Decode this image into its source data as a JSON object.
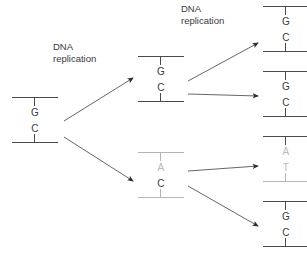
{
  "figure": {
    "label_color": "#3a3a3a",
    "normal_color": "#4a4a4a",
    "mutant_color": "#b9b9b9",
    "background": "#ffffff"
  },
  "labels": [
    {
      "id": "label-gen1",
      "text": "DNA\nreplication",
      "x": 53,
      "y": 41
    },
    {
      "id": "label-gen2",
      "text": "DNA\nreplication",
      "x": 181,
      "y": 3
    }
  ],
  "generations": [
    {
      "name": "parent",
      "units": [
        {
          "id": "unit-parent",
          "x": 12,
          "y": 97,
          "top_base": "G",
          "bottom_base": "C",
          "top_base_mutant": false,
          "bottom_base_mutant": false,
          "top_rail_mutant": false,
          "bottom_rail_mutant": false
        }
      ]
    },
    {
      "name": "first-generation",
      "units": [
        {
          "id": "unit-gen1-top",
          "x": 138,
          "y": 56,
          "top_base": "G",
          "bottom_base": "C",
          "top_base_mutant": false,
          "bottom_base_mutant": false,
          "top_rail_mutant": false,
          "bottom_rail_mutant": false
        },
        {
          "id": "unit-gen1-bottom",
          "x": 138,
          "y": 152,
          "top_base": "A",
          "bottom_base": "C",
          "top_base_mutant": true,
          "bottom_base_mutant": false,
          "top_rail_mutant": true,
          "bottom_rail_mutant": true
        }
      ]
    },
    {
      "name": "second-generation",
      "units": [
        {
          "id": "unit-gen2-1",
          "x": 263,
          "y": 6,
          "top_base": "G",
          "bottom_base": "C",
          "top_base_mutant": false,
          "bottom_base_mutant": false,
          "top_rail_mutant": false,
          "bottom_rail_mutant": false
        },
        {
          "id": "unit-gen2-2",
          "x": 263,
          "y": 71,
          "top_base": "G",
          "bottom_base": "C",
          "top_base_mutant": false,
          "bottom_base_mutant": false,
          "top_rail_mutant": false,
          "bottom_rail_mutant": false
        },
        {
          "id": "unit-gen2-3",
          "x": 263,
          "y": 136,
          "top_base": "A",
          "bottom_base": "T",
          "top_base_mutant": true,
          "bottom_base_mutant": true,
          "top_rail_mutant": false,
          "bottom_rail_mutant": true
        },
        {
          "id": "unit-gen2-4",
          "x": 263,
          "y": 201,
          "top_base": "G",
          "bottom_base": "C",
          "top_base_mutant": false,
          "bottom_base_mutant": false,
          "top_rail_mutant": false,
          "bottom_rail_mutant": false
        }
      ]
    }
  ],
  "arrows": [
    {
      "id": "arrow-parent-to-gen1-top",
      "x1": 64,
      "y1": 121,
      "x2": 133,
      "y2": 78
    },
    {
      "id": "arrow-parent-to-gen1-bottom",
      "x1": 64,
      "y1": 137,
      "x2": 133,
      "y2": 181
    },
    {
      "id": "arrow-gen1top-to-gen2-1",
      "x1": 188,
      "y1": 81,
      "x2": 258,
      "y2": 43
    },
    {
      "id": "arrow-gen1top-to-gen2-2",
      "x1": 188,
      "y1": 94,
      "x2": 258,
      "y2": 96
    },
    {
      "id": "arrow-gen1bot-to-gen2-3",
      "x1": 188,
      "y1": 171,
      "x2": 258,
      "y2": 166
    },
    {
      "id": "arrow-gen1bot-to-gen2-4",
      "x1": 188,
      "y1": 186,
      "x2": 258,
      "y2": 226
    }
  ]
}
